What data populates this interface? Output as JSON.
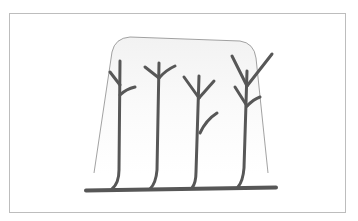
{
  "figure": {
    "colors": {
      "background": "#ffffff",
      "frame": "#bdbdbd",
      "stems": "#575757",
      "outline": "#8a8a8a"
    },
    "elements": {
      "cane": "horizontal-cane",
      "canopy_outline": "canopy-outline",
      "shoots": [
        {
          "id": "shoot-1",
          "branches": 2
        },
        {
          "id": "shoot-2",
          "branches": 2
        },
        {
          "id": "shoot-3",
          "branches": 3
        },
        {
          "id": "shoot-4",
          "branches": 4
        }
      ]
    }
  }
}
